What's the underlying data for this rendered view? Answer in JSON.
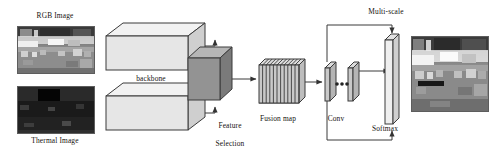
{
  "figure": {
    "type": "architecture-diagram",
    "background": "#ffffff"
  },
  "labels": {
    "rgb_image": "RGB Image",
    "thermal_image": "Thermal Image",
    "backbone": "backbone",
    "feature_selection_line1": "Feature",
    "feature_selection_line2": "Selection",
    "fusion_map": "Fusion map",
    "conv": "Conv",
    "multi_scale": "Multi-scale",
    "softmax": "Softmax"
  },
  "nodes": [
    {
      "id": "rgb-input",
      "kind": "image",
      "label": "RGB Image",
      "tone": "light-street-scene"
    },
    {
      "id": "thermal-input",
      "kind": "image",
      "label": "Thermal Image",
      "tone": "dark-thermal-scene"
    },
    {
      "id": "backbone-top",
      "kind": "cuboid",
      "label": "backbone"
    },
    {
      "id": "backbone-bottom",
      "kind": "cuboid",
      "label": "backbone"
    },
    {
      "id": "feature-selection",
      "kind": "cube",
      "label": "Feature Selection"
    },
    {
      "id": "fusion-map",
      "kind": "slab-stack",
      "label": "Fusion map",
      "slices": 11
    },
    {
      "id": "conv-1",
      "kind": "thin-slab",
      "label": "Conv"
    },
    {
      "id": "conv-2",
      "kind": "thin-slab",
      "label": "Conv"
    },
    {
      "id": "conv-ellipsis",
      "kind": "dots",
      "count": 3
    },
    {
      "id": "multi-scale-column",
      "kind": "tall-slab",
      "label": "Multi-scale"
    },
    {
      "id": "output-image",
      "kind": "image",
      "label": "",
      "tone": "segmented-street-scene"
    }
  ],
  "edges": [
    {
      "from": "backbone-top",
      "to": "feature-selection",
      "style": "elbow-down-arrow"
    },
    {
      "from": "backbone-bottom",
      "to": "feature-selection",
      "style": "elbow-up-arrow"
    },
    {
      "from": "feature-selection",
      "to": "fusion-map",
      "style": "straight-arrow"
    },
    {
      "from": "fusion-map",
      "to": "conv-1",
      "style": "straight-arrow"
    },
    {
      "from": "conv-2",
      "to": "multi-scale-column",
      "style": "straight-arrow"
    },
    {
      "from": "conv-1",
      "to": "multi-scale-column",
      "style": "multi-scale-top-bracket"
    },
    {
      "from": "conv-1",
      "to": "multi-scale-column",
      "style": "softmax-bottom-bracket"
    }
  ],
  "colors": {
    "stroke": "#3b3b3b",
    "cuboid_face": "#e4e4e4",
    "cuboid_top": "#f2f2f2",
    "cuboid_side": "#cfcfcf",
    "cube_face": "#8f8f8f",
    "cube_top": "#b6b6b6",
    "cube_side": "#7a7a7a",
    "slab_face": "#c9c9c9",
    "slab_top": "#e0e0e0",
    "text": "#15130f"
  }
}
